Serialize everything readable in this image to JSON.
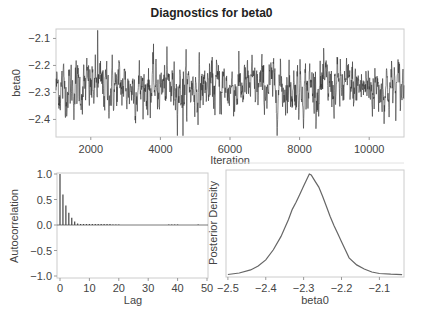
{
  "figure": {
    "title": "Diagnostics for beta0"
  },
  "chart_data": [
    {
      "type": "line",
      "name": "trace-plot",
      "title": "Diagnostics for beta0",
      "xlabel": "Iteration",
      "ylabel": "beta0",
      "xlim": [
        1000,
        11000
      ],
      "ylim": [
        -2.465,
        -2.065
      ],
      "xticks": [
        2000,
        4000,
        6000,
        8000,
        10000
      ],
      "yticks": [
        -2.1,
        -2.2,
        -2.3,
        -2.4
      ],
      "ytick_labels": [
        "-2.1",
        "-2.2",
        "-2.3",
        "-2.4"
      ],
      "grid": false,
      "series": [
        {
          "name": "beta0 MCMC trace",
          "description": "10000 post-burn-in draws fluctuating around -2.28 with range approx -2.46 to -2.07",
          "mean": -2.28,
          "sd": 0.05,
          "min": -2.46,
          "max": -2.07,
          "max_at_iteration": 2200,
          "min_at_iteration": 4650,
          "color": "#333333"
        }
      ]
    },
    {
      "type": "bar",
      "name": "autocorrelation-plot",
      "xlabel": "Lag",
      "ylabel": "Autocorrelation",
      "xlim": [
        0,
        50
      ],
      "ylim": [
        -1.0,
        1.0
      ],
      "xticks": [
        0,
        10,
        20,
        30,
        40,
        50
      ],
      "yticks": [
        1.0,
        0.5,
        0.0,
        -0.5,
        -1.0
      ],
      "ytick_labels": [
        "1.0",
        "0.5",
        "0.0",
        "-0.5",
        "-1.0"
      ],
      "grid": false,
      "categories": [
        0,
        1,
        2,
        3,
        4,
        5,
        6,
        7,
        8,
        9,
        10,
        11,
        12,
        13,
        14,
        15,
        16,
        17,
        18,
        19,
        20,
        21,
        22,
        23,
        24,
        25,
        26,
        27,
        28,
        29,
        30,
        31,
        32,
        33,
        34,
        35,
        36,
        37,
        38,
        39,
        40,
        41,
        42,
        43,
        44,
        45,
        46,
        47,
        48,
        49,
        50
      ],
      "values": [
        1.0,
        0.6,
        0.38,
        0.24,
        0.14,
        0.07,
        0.03,
        0.02,
        0.02,
        0.02,
        0.02,
        0.02,
        0.02,
        0.02,
        0.02,
        0.02,
        0.02,
        0.02,
        0.01,
        0.01,
        0.01,
        0.0,
        0.0,
        0.0,
        0.0,
        0.0,
        0.0,
        0.0,
        0.0,
        0.0,
        0.0,
        0.0,
        0.0,
        0.0,
        0.0,
        0.0,
        0.0,
        0.01,
        0.01,
        0.01,
        0.01,
        0.0,
        0.0,
        0.0,
        0.0,
        0.0,
        0.0,
        0.01,
        0.0,
        0.0,
        0.0
      ],
      "color": "#444444"
    },
    {
      "type": "line",
      "name": "posterior-density-plot",
      "xlabel": "beta0",
      "ylabel": "Posterior Density",
      "xlim": [
        -2.505,
        -2.035
      ],
      "xticks": [
        -2.5,
        -2.4,
        -2.3,
        -2.2,
        -2.1
      ],
      "xtick_labels": [
        "-2.5",
        "-2.4",
        "-2.3",
        "-2.2",
        "-2.1"
      ],
      "grid": false,
      "series": [
        {
          "name": "density",
          "x": [
            -2.5,
            -2.47,
            -2.44,
            -2.42,
            -2.4,
            -2.38,
            -2.36,
            -2.34,
            -2.33,
            -2.32,
            -2.31,
            -2.3,
            -2.29,
            -2.285,
            -2.28,
            -2.27,
            -2.26,
            -2.25,
            -2.24,
            -2.23,
            -2.22,
            -2.21,
            -2.2,
            -2.19,
            -2.18,
            -2.16,
            -2.14,
            -2.12,
            -2.1,
            -2.07,
            -2.04
          ],
          "y": [
            0.005,
            0.02,
            0.05,
            0.09,
            0.15,
            0.25,
            0.38,
            0.55,
            0.65,
            0.72,
            0.8,
            0.88,
            0.96,
            1.0,
            0.99,
            0.93,
            0.87,
            0.78,
            0.68,
            0.58,
            0.49,
            0.41,
            0.33,
            0.25,
            0.17,
            0.1,
            0.06,
            0.03,
            0.015,
            0.008,
            0.004
          ],
          "peak_x": -2.285,
          "color": "#666666"
        }
      ]
    }
  ],
  "panels": {
    "trace": {
      "xlabel": "Iteration",
      "ylabel": "beta0"
    },
    "acf": {
      "xlabel": "Lag",
      "ylabel": "Autocorrelation"
    },
    "density": {
      "xlabel": "beta0",
      "ylabel": "Posterior Density"
    }
  }
}
